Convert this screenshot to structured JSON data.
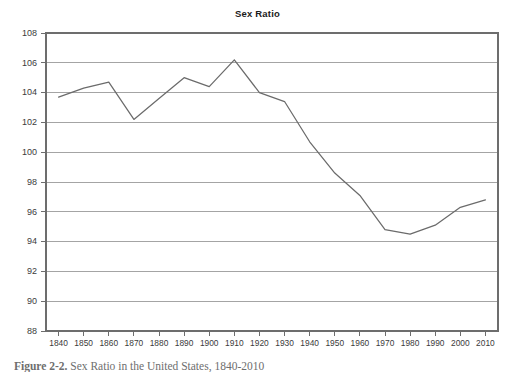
{
  "figure": {
    "title": "Sex Ratio",
    "caption_label": "Figure 2-2.",
    "caption_text": "Sex Ratio in the United States, 1840-2010"
  },
  "chart_data": {
    "type": "line",
    "title": "Sex Ratio",
    "xlabel": "",
    "ylabel": "",
    "xlim": [
      1835,
      2015
    ],
    "ylim": [
      88,
      108
    ],
    "grid": true,
    "legend": "none",
    "categories": [
      1840,
      1850,
      1860,
      1870,
      1880,
      1890,
      1900,
      1910,
      1920,
      1930,
      1940,
      1950,
      1960,
      1970,
      1980,
      1990,
      2000,
      2010
    ],
    "x_tick_labels": [
      "1840",
      "1850",
      "1860",
      "1870",
      "1880",
      "1890",
      "1900",
      "1910",
      "1920",
      "1930",
      "1940",
      "1950",
      "1960",
      "1970",
      "1980",
      "1990",
      "2000",
      "2010"
    ],
    "y_tick_labels": [
      "108",
      "106",
      "104",
      "102",
      "100",
      "98",
      "96",
      "94",
      "92",
      "90",
      "88"
    ],
    "y_ticks": [
      108,
      106,
      104,
      102,
      100,
      98,
      96,
      94,
      92,
      90,
      88
    ],
    "series": [
      {
        "name": "Sex Ratio",
        "color": "#6b6b6b",
        "values": [
          103.7,
          104.3,
          104.7,
          102.2,
          103.6,
          105.0,
          104.4,
          106.2,
          104.0,
          103.4,
          100.7,
          98.6,
          97.1,
          94.8,
          94.5,
          95.1,
          96.3,
          96.8
        ]
      }
    ]
  }
}
